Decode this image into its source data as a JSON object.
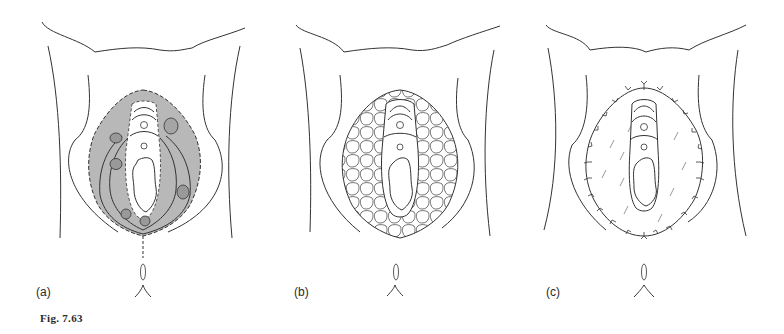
{
  "figure": {
    "caption": "Fig. 7.63",
    "panels": [
      {
        "label": "(a)",
        "style": "shaded-area-with-dashed-border-and-hatched-lesions"
      },
      {
        "label": "(b)",
        "style": "cobblestone-pattern-fill"
      },
      {
        "label": "(c)",
        "style": "sutured-outline-with-graft-strokes"
      }
    ],
    "colors": {
      "line": "#333333",
      "shade": "#b8b8b8",
      "background": "#ffffff"
    }
  }
}
